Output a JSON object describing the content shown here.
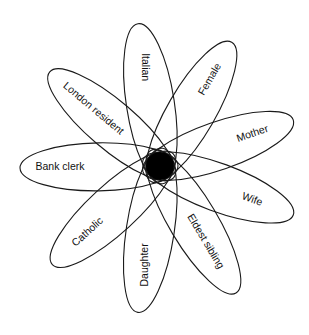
{
  "diagram": {
    "type": "flower-venn",
    "center": {
      "x": 160,
      "y": 166,
      "radius": 14
    },
    "petals": [
      {
        "label": "Italian",
        "angle": -98.8,
        "length": 144,
        "text_rotate": 90,
        "text_dist": 100
      },
      {
        "label": "Female",
        "angle": -59.9,
        "length": 143,
        "text_rotate": -60,
        "text_dist": 100
      },
      {
        "label": "Mother",
        "angle": -19.1,
        "length": 141,
        "text_rotate": -19,
        "text_dist": 98
      },
      {
        "label": "Wife",
        "angle": 20.2,
        "length": 142,
        "text_rotate": 20,
        "text_dist": 98
      },
      {
        "label": "Eldest sibling",
        "angle": 59.1,
        "length": 148,
        "text_rotate": 59,
        "text_dist": 88
      },
      {
        "label": "Daughter",
        "angle": 98.6,
        "length": 148,
        "text_rotate": -90,
        "text_dist": 100
      },
      {
        "label": "Catholic",
        "angle": 137.5,
        "length": 146,
        "text_rotate": -42,
        "text_dist": 98
      },
      {
        "label": "Bank clerk",
        "angle": 179.2,
        "length": 140,
        "text_rotate": 0,
        "text_dist": 100
      },
      {
        "label": "London resident",
        "angle": -139.5,
        "length": 145,
        "text_rotate": 40,
        "text_dist": 88
      }
    ],
    "stroke_color": "#1a1a1a",
    "hub_color": "#000000"
  }
}
